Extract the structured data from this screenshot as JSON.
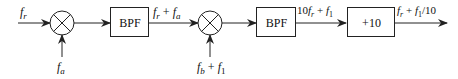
{
  "diagram": {
    "type": "block-diagram",
    "inputs": {
      "main_input": {
        "symbol": "f",
        "subscript": "r"
      },
      "mixer1_lo": {
        "symbol": "f",
        "subscript": "a"
      },
      "mixer2_lo": {
        "text": "f_b + f_1",
        "parts": [
          {
            "symbol": "f",
            "subscript": "b"
          },
          {
            "op": "+"
          },
          {
            "symbol": "f",
            "subscript": "1"
          }
        ]
      }
    },
    "blocks": [
      {
        "id": "mixer1",
        "kind": "mixer",
        "glyph": "⊗"
      },
      {
        "id": "bpf1",
        "kind": "filter",
        "label": "BPF"
      },
      {
        "id": "mixer2",
        "kind": "mixer",
        "glyph": "⊗"
      },
      {
        "id": "bpf2",
        "kind": "filter",
        "label": "BPF"
      },
      {
        "id": "div10",
        "kind": "divider",
        "label": "+10"
      }
    ],
    "edge_labels": {
      "bpf1_out": {
        "text": "f_r + f_a"
      },
      "bpf2_out": {
        "text": "10 f_r + f_1"
      },
      "output": {
        "text": "f_r + f_1/10"
      }
    },
    "labels": {
      "fr": "f",
      "fr_sub": "r",
      "fa": "f",
      "fa_sub": "a",
      "fb": "f",
      "fb_sub": "b",
      "f1": "f",
      "f1_sub": "1",
      "plus": "+",
      "ten": "10",
      "div_suffix": "/10",
      "bpf1": "BPF",
      "bpf2": "BPF",
      "div": "+10"
    },
    "colors": {
      "stroke": "#222222",
      "text": "#111111",
      "background": "#ffffff"
    }
  }
}
